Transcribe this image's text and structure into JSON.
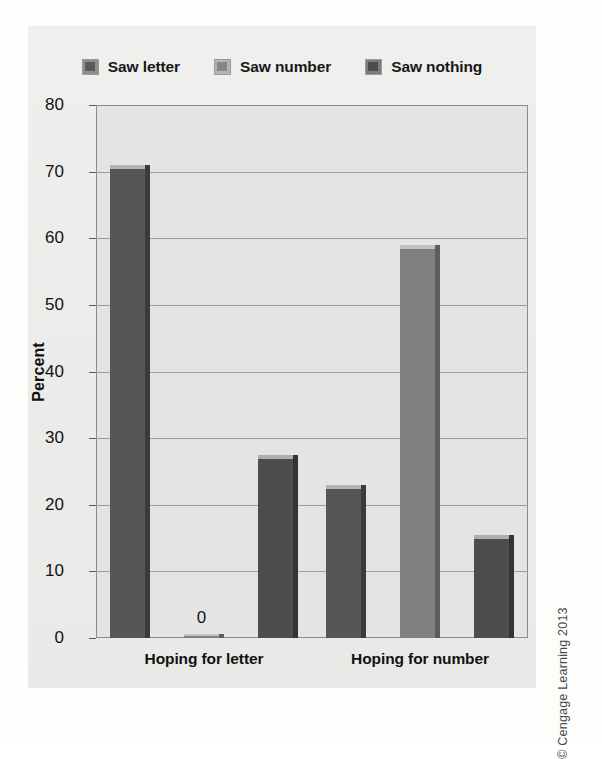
{
  "chart_data": {
    "type": "bar",
    "title": "",
    "xlabel": "",
    "ylabel": "Percent",
    "ylim": [
      0,
      80
    ],
    "ytick_step": 10,
    "yticks": [
      80,
      70,
      60,
      50,
      40,
      30,
      20,
      10,
      0
    ],
    "grid": true,
    "legend_position": "top-center",
    "categories": [
      "Hoping for letter",
      "Hoping for number"
    ],
    "series": [
      {
        "name": "Saw letter",
        "color": "#565654",
        "values": [
          71,
          23
        ]
      },
      {
        "name": "Saw number",
        "color": "#808080",
        "values": [
          0,
          59
        ]
      },
      {
        "name": "Saw nothing",
        "color": "#4d4d4b",
        "values": [
          27.5,
          15.5
        ]
      }
    ],
    "data_labels": [
      {
        "series": "Saw number",
        "category": "Hoping for letter",
        "text": "0"
      }
    ]
  },
  "legend": {
    "items": [
      {
        "label": "Saw letter",
        "swatch": "legend-swatch-saw-letter"
      },
      {
        "label": "Saw number",
        "swatch": "legend-swatch-saw-number"
      },
      {
        "label": "Saw nothing",
        "swatch": "legend-swatch-saw-nothing"
      }
    ]
  },
  "axis": {
    "y_title": "Percent"
  },
  "credit": {
    "text": "© Cengage Learning 2013"
  }
}
